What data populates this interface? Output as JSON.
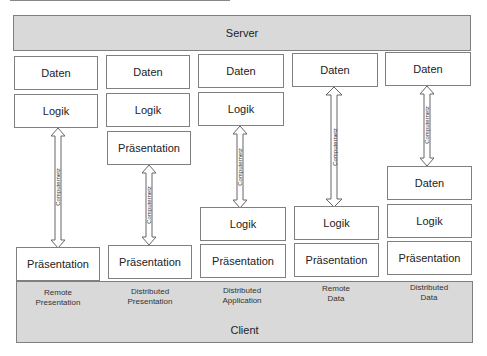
{
  "server": {
    "label": "Server"
  },
  "client": {
    "label": "Client"
  },
  "arrow_label": "Computernetz",
  "columns": [
    {
      "name": "Remote Presentation",
      "caption_line1": "Remote",
      "caption_line2": "Presentation",
      "server_boxes": [
        "Daten",
        "Logik"
      ],
      "client_boxes": [
        "Präsentation"
      ]
    },
    {
      "name": "Distributed Presentation",
      "caption_line1": "Distributed",
      "caption_line2": "Presentation",
      "server_boxes": [
        "Daten",
        "Logik",
        "Präsentation"
      ],
      "client_boxes": [
        "Präsentation"
      ]
    },
    {
      "name": "Distributed Application",
      "caption_line1": "Distributed",
      "caption_line2": "Application",
      "server_boxes": [
        "Daten",
        "Logik"
      ],
      "client_boxes": [
        "Logik",
        "Präsentation"
      ]
    },
    {
      "name": "Remote Data",
      "caption_line1": "Remote",
      "caption_line2": "Data",
      "server_boxes": [
        "Daten"
      ],
      "client_boxes": [
        "Logik",
        "Präsentation"
      ]
    },
    {
      "name": "Distributed Data",
      "caption_line1": "Distributed",
      "caption_line2": "Data",
      "server_boxes": [
        "Daten"
      ],
      "client_boxes": [
        "Daten",
        "Logik",
        "Präsentation"
      ]
    }
  ]
}
